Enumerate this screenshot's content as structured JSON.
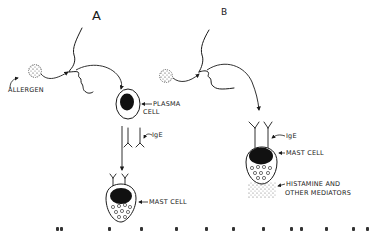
{
  "diagram": {
    "panels": [
      {
        "id": "A",
        "title": "A",
        "labels": {
          "allergen": "ALLERGEN",
          "plasma_cell": "PLASMA",
          "plasma_cell_2": "CELL",
          "ige": "IgE",
          "mast_cell": "MAST CELL"
        }
      },
      {
        "id": "B",
        "title": "B",
        "labels": {
          "ige": "IgE",
          "mast_cell": "MAST CELL",
          "mediators_1": "HISTAMINE AND",
          "mediators_2": "OTHER MEDIATORS"
        }
      }
    ],
    "colors": {
      "ink": "#1a1a1a",
      "background": "#ffffff"
    }
  }
}
